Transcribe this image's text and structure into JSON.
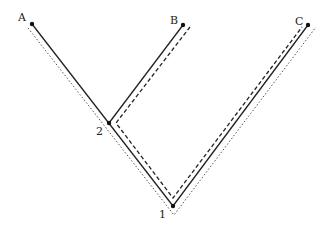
{
  "diagram": {
    "type": "phylogenetic-tree",
    "colors": {
      "line": "#222222",
      "dotted": "#555555",
      "background": "#ffffff"
    },
    "taxa": [
      {
        "label": "A",
        "x": 32,
        "y": 24
      },
      {
        "label": "B",
        "x": 183,
        "y": 25
      },
      {
        "label": "C",
        "x": 308,
        "y": 25
      }
    ],
    "nodes": [
      {
        "label": "1",
        "x": 173,
        "y": 206
      },
      {
        "label": "2",
        "x": 109,
        "y": 123
      }
    ],
    "paths": {
      "solid": "tree branches",
      "dashed": "path from B to C via nodes 2 and 1",
      "dotted": "path from A to C via node 1"
    }
  }
}
